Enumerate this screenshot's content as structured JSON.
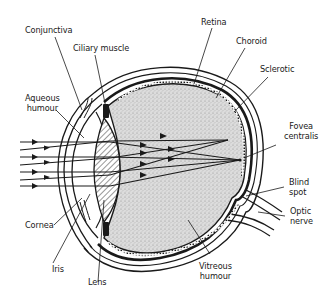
{
  "diagram": {
    "colors": {
      "ink": "#1a1a1a",
      "vitreous_fill": "#d4d4d4",
      "background": "#ffffff"
    },
    "labels": {
      "conjunctiva": "Conjunctiva",
      "ciliary_muscle": "Ciliary muscle",
      "aqueous_humour": [
        "Aqueous",
        "humour"
      ],
      "retina": "Retina",
      "choroid": "Choroid",
      "sclerotic": "Sclerotic",
      "fovea_centralis": [
        "Fovea",
        "centralis"
      ],
      "blind_spot": [
        "Blind",
        "spot"
      ],
      "optic_nerve": [
        "Optic",
        "nerve"
      ],
      "cornea": "Cornea",
      "iris": "Iris",
      "lens": "Lens",
      "vitreous_humour": [
        "Vitreous",
        "humour"
      ]
    }
  }
}
